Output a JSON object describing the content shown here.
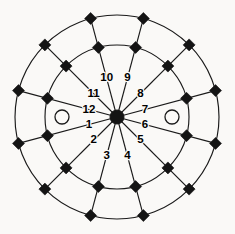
{
  "figure": {
    "background_color": "#faf9f7",
    "line_color": "#1a1a1a",
    "marker_color": "#141414",
    "label_color": "#000000"
  },
  "geometry": {
    "center_x": 117,
    "center_y": 117,
    "outer_radius": 102,
    "inner_radius": 72,
    "spoke_count": 12,
    "spoke_step_degrees": 30,
    "hub_radius": 7,
    "marker_half_size": 6,
    "hollow_dot_radius": 7,
    "hollow_dot_offset": 55
  },
  "sectors": [
    {
      "id": 1,
      "label": "1",
      "angle_deg": 195,
      "label_radius": 29
    },
    {
      "id": 2,
      "label": "2",
      "angle_deg": 225,
      "label_radius": 33
    },
    {
      "id": 3,
      "label": "3",
      "angle_deg": 255,
      "label_radius": 40
    },
    {
      "id": 4,
      "label": "4",
      "angle_deg": 285,
      "label_radius": 40
    },
    {
      "id": 5,
      "label": "5",
      "angle_deg": 315,
      "label_radius": 33
    },
    {
      "id": 6,
      "label": "6",
      "angle_deg": 345,
      "label_radius": 29
    },
    {
      "id": 7,
      "label": "7",
      "angle_deg": 15,
      "label_radius": 29
    },
    {
      "id": 8,
      "label": "8",
      "angle_deg": 45,
      "label_radius": 33
    },
    {
      "id": 9,
      "label": "9",
      "angle_deg": 75,
      "label_radius": 40
    },
    {
      "id": 10,
      "label": "10",
      "angle_deg": 105,
      "label_radius": 40
    },
    {
      "id": 11,
      "label": "11",
      "angle_deg": 135,
      "label_radius": 33
    },
    {
      "id": 12,
      "label": "12",
      "angle_deg": 165,
      "label_radius": 29
    }
  ],
  "markers": {
    "hub": {
      "name": "center-hub",
      "shape": "filled-circle"
    },
    "ring_nodes": {
      "name": "ring-node",
      "shape": "filled-diamond"
    },
    "axis_dots": {
      "name": "axis-hollow-dot",
      "shape": "hollow-circle",
      "count": 2
    }
  },
  "chart_data": {
    "type": "pie",
    "subtitle": "",
    "xlabel": "",
    "ylabel": "",
    "categories": [
      "1",
      "2",
      "3",
      "4",
      "5",
      "6",
      "7",
      "8",
      "9",
      "10",
      "11",
      "12"
    ],
    "values": [
      1,
      1,
      1,
      1,
      1,
      1,
      1,
      1,
      1,
      1,
      1,
      1
    ],
    "rings": [
      {
        "name": "inner ring",
        "radius": 72
      },
      {
        "name": "outer ring",
        "radius": 102
      }
    ],
    "grid": true,
    "legend_position": "none"
  }
}
